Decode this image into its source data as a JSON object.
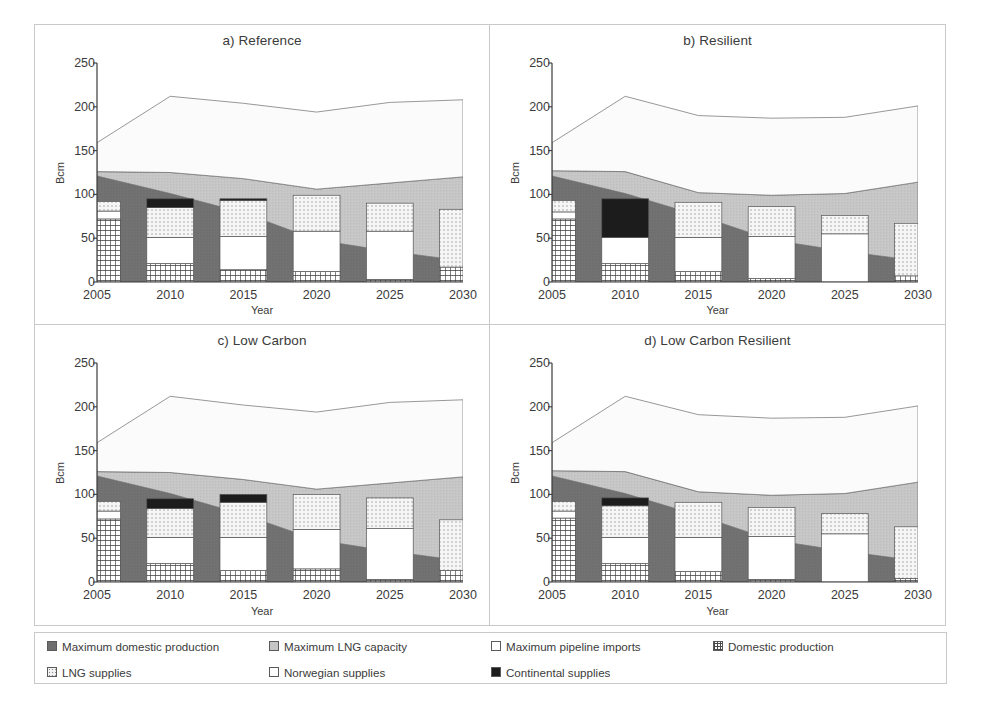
{
  "figure": {
    "axis_y_label": "Bcm",
    "axis_x_label": "Year"
  },
  "legend": {
    "items": [
      {
        "label": "Maximum domestic production",
        "swatch": "dark-gray-fill"
      },
      {
        "label": "Maximum LNG capacity",
        "swatch": "light-gray-fill"
      },
      {
        "label": "Maximum pipeline imports",
        "swatch": "white-fill"
      },
      {
        "label": "Domestic production",
        "swatch": "checkered-fill"
      },
      {
        "label": "LNG supplies",
        "swatch": "dotted-fill"
      },
      {
        "label": "Norwegian supplies",
        "swatch": "white-fill"
      },
      {
        "label": "Continental supplies",
        "swatch": "black-fill"
      }
    ]
  },
  "colors": {
    "max_domestic_production": "#6e6e6e",
    "max_lng_capacity": "#c6c6c6",
    "max_pipeline_imports": "#fbfbfb",
    "domestic_production": "#ffffff",
    "lng_supplies": "#f2f2f2",
    "norwegian_supplies": "#ffffff",
    "continental_supplies": "#1c1c1c",
    "axis_line": "#3b3b3b",
    "panel_border": "#c9c9c9",
    "text": "#3b3b3b"
  },
  "chart_data": [
    {
      "type": "area",
      "panel": "a",
      "title": "a) Reference",
      "xlabel": "Year",
      "ylabel": "Bcm",
      "ylim": [
        0,
        250
      ],
      "yticks": [
        0,
        50,
        100,
        150,
        200,
        250
      ],
      "x": [
        2005,
        2010,
        2015,
        2020,
        2025,
        2030
      ],
      "xticklabels": [
        "2005",
        "2010",
        "2015",
        "2020",
        "2025",
        "2030"
      ],
      "grid": false,
      "legend_position": "below-figure",
      "stacked_areas": [
        {
          "name": "Maximum domestic production",
          "values": [
            121,
            101,
            79,
            48,
            35,
            24
          ]
        },
        {
          "name": "Maximum LNG capacity",
          "values": [
            5,
            24,
            39,
            58,
            78,
            96
          ]
        },
        {
          "name": "Maximum pipeline imports",
          "values": [
            33,
            87,
            86,
            88,
            92,
            88
          ]
        }
      ],
      "area_cumulative_top": [
        159,
        212,
        204,
        194,
        205,
        208
      ],
      "bars": {
        "width_bcm_years": 3.2,
        "stacked_segments": [
          {
            "name": "Domestic production",
            "values": [
              72,
              21,
              14,
              12,
              3,
              17
            ]
          },
          {
            "name": "Norwegian supplies",
            "values": [
              9,
              30,
              38,
              46,
              55,
              0
            ]
          },
          {
            "name": "LNG supplies",
            "values": [
              11,
              34,
              41,
              41,
              32,
              66
            ]
          },
          {
            "name": "Continental supplies",
            "values": [
              0,
              10,
              2,
              0,
              0,
              0
            ]
          }
        ],
        "totals": [
          92,
          95,
          95,
          99,
          90,
          83
        ]
      }
    },
    {
      "type": "area",
      "panel": "b",
      "title": "b) Resilient",
      "xlabel": "Year",
      "ylabel": "Bcm",
      "ylim": [
        0,
        250
      ],
      "yticks": [
        0,
        50,
        100,
        150,
        200,
        250
      ],
      "x": [
        2005,
        2010,
        2015,
        2020,
        2025,
        2030
      ],
      "xticklabels": [
        "2005",
        "2010",
        "2015",
        "2020",
        "2025",
        "2030"
      ],
      "grid": false,
      "legend_position": "below-figure",
      "stacked_areas": [
        {
          "name": "Maximum domestic production",
          "values": [
            121,
            101,
            76,
            48,
            35,
            24
          ]
        },
        {
          "name": "Maximum LNG capacity",
          "values": [
            6,
            25,
            26,
            51,
            66,
            90
          ]
        },
        {
          "name": "Maximum pipeline imports",
          "values": [
            32,
            86,
            88,
            88,
            87,
            87
          ]
        }
      ],
      "area_cumulative_top": [
        159,
        212,
        190,
        187,
        188,
        201
      ],
      "bars": {
        "width_bcm_years": 3.2,
        "stacked_segments": [
          {
            "name": "Domestic production",
            "values": [
              72,
              21,
              12,
              4,
              0,
              7
            ]
          },
          {
            "name": "Norwegian supplies",
            "values": [
              8,
              30,
              39,
              48,
              55,
              0
            ]
          },
          {
            "name": "LNG supplies",
            "values": [
              13,
              0,
              40,
              34,
              21,
              60
            ]
          },
          {
            "name": "Continental supplies",
            "values": [
              0,
              44,
              0,
              0,
              0,
              0
            ]
          }
        ],
        "totals": [
          93,
          95,
          91,
          86,
          76,
          67
        ]
      }
    },
    {
      "type": "area",
      "panel": "c",
      "title": "c) Low Carbon",
      "xlabel": "Year",
      "ylabel": "Bcm",
      "ylim": [
        0,
        250
      ],
      "yticks": [
        0,
        50,
        100,
        150,
        200,
        250
      ],
      "x": [
        2005,
        2010,
        2015,
        2020,
        2025,
        2030
      ],
      "xticklabels": [
        "2005",
        "2010",
        "2015",
        "2020",
        "2025",
        "2030"
      ],
      "grid": false,
      "legend_position": "below-figure",
      "stacked_areas": [
        {
          "name": "Maximum domestic production",
          "values": [
            121,
            101,
            77,
            48,
            35,
            24
          ]
        },
        {
          "name": "Maximum LNG capacity",
          "values": [
            5,
            24,
            40,
            58,
            78,
            96
          ]
        },
        {
          "name": "Maximum pipeline imports",
          "values": [
            33,
            87,
            85,
            88,
            92,
            88
          ]
        }
      ],
      "area_cumulative_top": [
        159,
        212,
        202,
        194,
        205,
        208
      ],
      "bars": {
        "width_bcm_years": 3.2,
        "stacked_segments": [
          {
            "name": "Domestic production",
            "values": [
              72,
              21,
              13,
              15,
              3,
              13
            ]
          },
          {
            "name": "Norwegian supplies",
            "values": [
              9,
              30,
              38,
              45,
              58,
              0
            ]
          },
          {
            "name": "LNG supplies",
            "values": [
              11,
              33,
              40,
              40,
              35,
              58
            ]
          },
          {
            "name": "Continental supplies",
            "values": [
              0,
              11,
              9,
              0,
              0,
              0
            ]
          }
        ],
        "totals": [
          92,
          95,
          100,
          100,
          96,
          71
        ]
      }
    },
    {
      "type": "area",
      "panel": "d",
      "title": "d) Low Carbon Resilient",
      "xlabel": "Year",
      "ylabel": "Bcm",
      "ylim": [
        0,
        250
      ],
      "yticks": [
        0,
        50,
        100,
        150,
        200,
        250
      ],
      "x": [
        2005,
        2010,
        2015,
        2020,
        2025,
        2030
      ],
      "xticklabels": [
        "2005",
        "2010",
        "2015",
        "2020",
        "2025",
        "2030"
      ],
      "grid": false,
      "legend_position": "below-figure",
      "stacked_areas": [
        {
          "name": "Maximum domestic production",
          "values": [
            121,
            101,
            76,
            48,
            35,
            24
          ]
        },
        {
          "name": "Maximum LNG capacity",
          "values": [
            6,
            25,
            27,
            51,
            66,
            90
          ]
        },
        {
          "name": "Maximum pipeline imports",
          "values": [
            32,
            86,
            88,
            88,
            87,
            87
          ]
        }
      ],
      "area_cumulative_top": [
        159,
        212,
        191,
        187,
        188,
        201
      ],
      "bars": {
        "width_bcm_years": 3.2,
        "stacked_segments": [
          {
            "name": "Domestic production",
            "values": [
              73,
              21,
              12,
              3,
              0,
              4
            ]
          },
          {
            "name": "Norwegian supplies",
            "values": [
              8,
              30,
              39,
              49,
              55,
              0
            ]
          },
          {
            "name": "LNG supplies",
            "values": [
              11,
              36,
              40,
              33,
              23,
              59
            ]
          },
          {
            "name": "Continental supplies",
            "values": [
              0,
              9,
              0,
              0,
              0,
              0
            ]
          }
        ],
        "totals": [
          92,
          96,
          91,
          85,
          78,
          63
        ]
      }
    }
  ]
}
